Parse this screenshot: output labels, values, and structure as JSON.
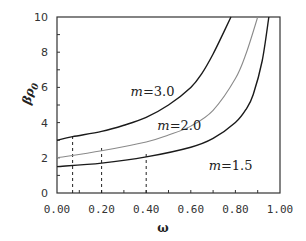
{
  "chart_data": {
    "type": "line",
    "title": "",
    "xlabel": "ω",
    "ylabel": "βρ0",
    "xlim": [
      0,
      1.0
    ],
    "ylim": [
      0,
      10
    ],
    "grid": false,
    "legend": "inline labels",
    "x_ticks": [
      "0.00",
      "0.20",
      "0.40",
      "0.60",
      "0.80",
      "1.00"
    ],
    "y_ticks": [
      "0",
      "2",
      "4",
      "6",
      "8",
      "10"
    ],
    "series": [
      {
        "name": "m=3.0",
        "color": "#1a1a1a",
        "x": [
          0.0,
          0.07,
          0.2,
          0.3,
          0.4,
          0.5,
          0.6,
          0.65,
          0.7,
          0.75,
          0.78
        ],
        "y": [
          3.0,
          3.2,
          3.5,
          3.85,
          4.3,
          5.0,
          6.0,
          6.8,
          7.9,
          9.2,
          10.0
        ]
      },
      {
        "name": "m=2.0",
        "color": "#8a8a8a",
        "x": [
          0.0,
          0.2,
          0.4,
          0.5,
          0.6,
          0.7,
          0.8,
          0.85,
          0.9
        ],
        "y": [
          2.0,
          2.4,
          2.9,
          3.3,
          3.8,
          4.7,
          6.5,
          8.0,
          10.0
        ]
      },
      {
        "name": "m=1.5",
        "color": "#1a1a1a",
        "x": [
          0.0,
          0.2,
          0.4,
          0.6,
          0.7,
          0.8,
          0.85,
          0.88,
          0.92,
          0.95
        ],
        "y": [
          1.5,
          1.7,
          2.05,
          2.6,
          3.1,
          4.0,
          4.8,
          5.6,
          7.5,
          10.0
        ]
      }
    ],
    "annotations": [
      {
        "text_m": "m",
        "text_val": "=3.0",
        "x": 0.33,
        "y": 5.5
      },
      {
        "text_m": "m",
        "text_val": "=2.0",
        "x": 0.45,
        "y": 3.6
      },
      {
        "text_m": "m",
        "text_val": "=1.5",
        "x": 0.68,
        "y": 1.3
      }
    ],
    "dashed_markers": [
      {
        "x": 0.07,
        "y_top": 3.2
      },
      {
        "x": 0.2,
        "y_top": 2.4
      },
      {
        "x": 0.4,
        "y_top": 2.05
      }
    ]
  }
}
